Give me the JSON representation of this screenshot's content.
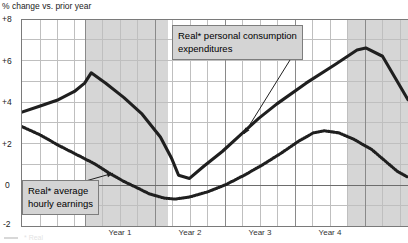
{
  "axis_title": "% change vs. prior year",
  "y_ticks": [
    {
      "label": "+8",
      "value": 8
    },
    {
      "label": "+6",
      "value": 6
    },
    {
      "label": "+4",
      "value": 4
    },
    {
      "label": "+2",
      "value": 2
    },
    {
      "label": "0",
      "value": 0
    },
    {
      "label": "-2",
      "value": -2
    }
  ],
  "year_labels": [
    {
      "label": "Year 1",
      "center": 120
    },
    {
      "label": "Year 2",
      "center": 190
    },
    {
      "label": "Year 3",
      "center": 260
    },
    {
      "label": "Year 4",
      "center": 330
    }
  ],
  "callouts": [
    {
      "name": "pce-callout",
      "line1": "Real* personal consumption",
      "line2": "expenditures"
    },
    {
      "name": "earnings-callout",
      "line1": "Real* average",
      "line2": "hourly earnings"
    }
  ],
  "colors": {
    "line_solid": "#1f1f1f",
    "line_dotted": "#1f1f1f",
    "shading": "#d6d6d6",
    "grid": "#bfbfbf",
    "axis": "#7a7a7a",
    "callout_fill": "#d4d4d4",
    "callout_border": "#7d7d7d"
  },
  "footnote": "* Real",
  "chart_data": {
    "type": "line",
    "title": "",
    "subtitle": "",
    "xlabel": "",
    "ylabel": "% change vs. prior year",
    "ylim": [
      -2,
      8
    ],
    "xlim": [
      0,
      5.3
    ],
    "grid": true,
    "legend_position": "annotations",
    "y_tick_values": [
      8,
      6,
      4,
      2,
      0,
      -2
    ],
    "x_tick_labels": [
      "Year 1",
      "Year 2",
      "Year 3",
      "Year 4"
    ],
    "shaded_bands": [
      {
        "x_start": 0.95,
        "x_end": 2.1,
        "color": "#d6d6d6"
      },
      {
        "x_start": 4.7,
        "x_end": 5.3,
        "color": "#d6d6d6"
      }
    ],
    "series": [
      {
        "name": "Real* personal consumption expenditures",
        "style": "solid",
        "points": [
          {
            "x": 0.0,
            "y": 3.5
          },
          {
            "x": 0.25,
            "y": 3.8
          },
          {
            "x": 0.5,
            "y": 4.1
          },
          {
            "x": 0.72,
            "y": 4.5
          },
          {
            "x": 0.86,
            "y": 4.9
          },
          {
            "x": 0.95,
            "y": 5.4
          },
          {
            "x": 1.15,
            "y": 4.9
          },
          {
            "x": 1.4,
            "y": 4.2
          },
          {
            "x": 1.65,
            "y": 3.4
          },
          {
            "x": 1.9,
            "y": 2.3
          },
          {
            "x": 2.05,
            "y": 1.3
          },
          {
            "x": 2.15,
            "y": 0.45
          },
          {
            "x": 2.3,
            "y": 0.3
          },
          {
            "x": 2.5,
            "y": 0.9
          },
          {
            "x": 2.75,
            "y": 1.6
          },
          {
            "x": 3.0,
            "y": 2.4
          },
          {
            "x": 3.25,
            "y": 3.2
          },
          {
            "x": 3.5,
            "y": 3.9
          },
          {
            "x": 3.9,
            "y": 4.9
          },
          {
            "x": 4.3,
            "y": 5.8
          },
          {
            "x": 4.6,
            "y": 6.5
          },
          {
            "x": 4.72,
            "y": 6.6
          },
          {
            "x": 4.95,
            "y": 6.2
          },
          {
            "x": 5.3,
            "y": 4.1
          }
        ]
      },
      {
        "name": "Real* average hourly earnings",
        "style": "dotted",
        "points": [
          {
            "x": 0.0,
            "y": 2.8
          },
          {
            "x": 0.25,
            "y": 2.4
          },
          {
            "x": 0.5,
            "y": 1.9
          },
          {
            "x": 0.75,
            "y": 1.45
          },
          {
            "x": 1.0,
            "y": 1.0
          },
          {
            "x": 1.2,
            "y": 0.55
          },
          {
            "x": 1.4,
            "y": 0.15
          },
          {
            "x": 1.55,
            "y": -0.1
          },
          {
            "x": 1.75,
            "y": -0.45
          },
          {
            "x": 1.95,
            "y": -0.65
          },
          {
            "x": 2.1,
            "y": -0.7
          },
          {
            "x": 2.3,
            "y": -0.6
          },
          {
            "x": 2.55,
            "y": -0.35
          },
          {
            "x": 2.8,
            "y": 0.0
          },
          {
            "x": 3.05,
            "y": 0.45
          },
          {
            "x": 3.3,
            "y": 0.95
          },
          {
            "x": 3.55,
            "y": 1.5
          },
          {
            "x": 3.8,
            "y": 2.1
          },
          {
            "x": 4.0,
            "y": 2.5
          },
          {
            "x": 4.15,
            "y": 2.6
          },
          {
            "x": 4.35,
            "y": 2.5
          },
          {
            "x": 4.55,
            "y": 2.2
          },
          {
            "x": 4.8,
            "y": 1.7
          },
          {
            "x": 5.0,
            "y": 1.1
          },
          {
            "x": 5.15,
            "y": 0.65
          },
          {
            "x": 5.3,
            "y": 0.35
          }
        ]
      }
    ],
    "annotations": [
      {
        "text": "Real* personal consumption expenditures",
        "points_to_series": "Real* personal consumption expenditures",
        "arrow_target_x": 3.05,
        "arrow_target_y": 2.45
      },
      {
        "text": "Real* average hourly earnings",
        "points_to_series": "Real* average hourly earnings",
        "arrow_target_x": 1.25,
        "arrow_target_y": 0.55
      }
    ]
  }
}
